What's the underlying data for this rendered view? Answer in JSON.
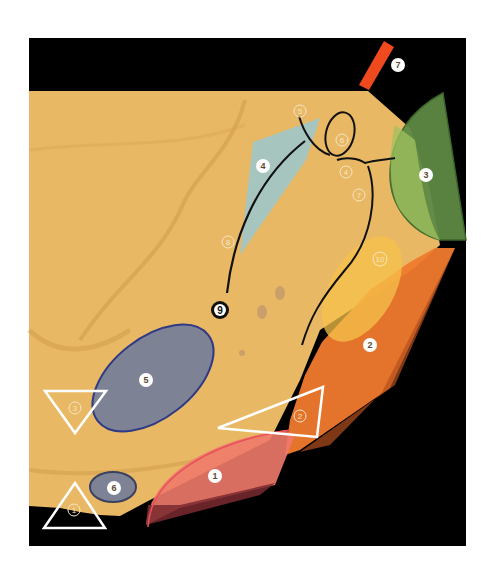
{
  "figure": {
    "type": "anatomical annotation diagram (dental impression)",
    "colors": {
      "background": "#000000",
      "impression": "#e9b865",
      "region_1": "#ef7a6a",
      "region_2": "#f07a2e",
      "region_3": "#5e8a45",
      "region_4": "#9fc7c9",
      "region_5": "#7d8295",
      "region_6": "#7d8295",
      "region_10": "#f5c24a",
      "bar_7": "#ee4a1d",
      "outline": "#ffffff",
      "curve": "#111111"
    },
    "solid_labels": [
      {
        "id": "1",
        "text": "1"
      },
      {
        "id": "2",
        "text": "2"
      },
      {
        "id": "3",
        "text": "3"
      },
      {
        "id": "4",
        "text": "4"
      },
      {
        "id": "5",
        "text": "5"
      },
      {
        "id": "6",
        "text": "6"
      },
      {
        "id": "7",
        "text": "7"
      }
    ],
    "outline_labels": [
      {
        "id": "o1",
        "text": "1"
      },
      {
        "id": "o2",
        "text": "2"
      },
      {
        "id": "o3",
        "text": "3"
      },
      {
        "id": "o4",
        "text": "4"
      },
      {
        "id": "o5",
        "text": "5"
      },
      {
        "id": "o6",
        "text": "6"
      },
      {
        "id": "o7",
        "text": "7"
      },
      {
        "id": "o8",
        "text": "8"
      },
      {
        "id": "o10",
        "text": "10"
      }
    ],
    "black_labels": [
      {
        "id": "9",
        "text": "9"
      }
    ]
  }
}
